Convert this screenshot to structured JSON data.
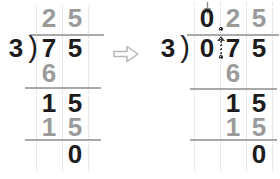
{
  "colors": {
    "background": "#ffffff",
    "black": "#1c1c1c",
    "gray": "#9b9b9b",
    "rule": "#a9a9a9",
    "guide": "#d4d4d4",
    "transform_arrow_outline": "#b7b7b7",
    "annotation_dark": "#3f3f3f",
    "annotation_gray": "#8a8a8a"
  },
  "icons": {
    "transform_arrow": "rightwards-white-arrow",
    "write_zero_arrow": "small-down-arrow",
    "decimal_carry_arrow": "dotted-up-arrow"
  },
  "figures": [
    {
      "divisor": "3",
      "dividend": "75",
      "quotient": "25",
      "work_rows": [
        "6",
        "15",
        "15",
        "0"
      ],
      "layout": {
        "col_centers": [
          49,
          75
        ],
        "rows_y": [
          8,
          38,
          63,
          93,
          117,
          144
        ],
        "guides_x": [
          36,
          62,
          88
        ],
        "guide_top": 6,
        "guide_bottom": 171,
        "bar": {
          "y": 34,
          "x1": 30,
          "x2": 104
        },
        "lines": [
          {
            "y": 87,
            "x1": 25,
            "x2": 101
          },
          {
            "y": 139,
            "x1": 25,
            "x2": 101
          }
        ]
      },
      "cells": [
        {
          "text": "3",
          "row": 1,
          "x": 16,
          "color": "black",
          "name": "divisor-digit"
        },
        {
          "text": ")",
          "row": 1,
          "x": 33,
          "kind": "paren",
          "color": "black",
          "name": "division-bracket-paren"
        },
        {
          "text": "2",
          "row": 0,
          "col": 0,
          "color": "gray",
          "name": "quotient-digit"
        },
        {
          "text": "5",
          "row": 0,
          "col": 1,
          "color": "gray",
          "name": "quotient-digit"
        },
        {
          "text": "7",
          "row": 1,
          "col": 0,
          "color": "black",
          "name": "dividend-digit"
        },
        {
          "text": "5",
          "row": 1,
          "col": 1,
          "color": "black",
          "name": "dividend-digit"
        },
        {
          "text": "6",
          "row": 2,
          "col": 0,
          "color": "gray",
          "name": "product-digit"
        },
        {
          "text": "1",
          "row": 3,
          "col": 0,
          "color": "black",
          "name": "remainder-digit"
        },
        {
          "text": "5",
          "row": 3,
          "col": 1,
          "color": "black",
          "name": "remainder-digit"
        },
        {
          "text": "1",
          "row": 4,
          "col": 0,
          "color": "gray",
          "name": "subtrahend-digit"
        },
        {
          "text": "5",
          "row": 4,
          "col": 1,
          "color": "gray",
          "name": "subtrahend-digit"
        },
        {
          "text": "0",
          "row": 5,
          "col": 1,
          "color": "black",
          "name": "final-remainder-digit"
        }
      ]
    },
    {
      "divisor": "3",
      "dividend": "0.75",
      "quotient": "0.25",
      "work_rows": [
        "6",
        "15",
        "15",
        "0"
      ],
      "layout": {
        "col_centers": [
          207,
          233,
          259
        ],
        "rows_y": [
          8,
          38,
          63,
          93,
          117,
          144
        ],
        "guides_x": [
          194,
          220,
          246,
          272
        ],
        "guide_top": 2,
        "guide_bottom": 171,
        "bar": {
          "y": 34,
          "x1": 187,
          "x2": 279
        },
        "lines": [
          {
            "y": 88,
            "x1": 190,
            "x2": 277
          },
          {
            "y": 139,
            "x1": 190,
            "x2": 277
          }
        ]
      },
      "cells": [
        {
          "text": "3",
          "row": 1,
          "x": 168,
          "color": "black",
          "name": "divisor-digit"
        },
        {
          "text": ")",
          "row": 1,
          "x": 185,
          "kind": "paren",
          "color": "black",
          "name": "division-bracket-paren"
        },
        {
          "text": "0",
          "row": 0,
          "col": 0,
          "color": "black",
          "name": "quotient-zero-digit"
        },
        {
          "text": "2",
          "row": 0,
          "col": 1,
          "color": "gray",
          "name": "quotient-digit"
        },
        {
          "text": "5",
          "row": 0,
          "col": 2,
          "color": "gray",
          "name": "quotient-digit"
        },
        {
          "text": "0",
          "row": 1,
          "col": 0,
          "color": "black",
          "name": "dividend-digit"
        },
        {
          "text": "7",
          "row": 1,
          "col": 1,
          "color": "black",
          "name": "dividend-digit"
        },
        {
          "text": "5",
          "row": 1,
          "col": 2,
          "color": "black",
          "name": "dividend-digit"
        },
        {
          "text": "6",
          "row": 2,
          "col": 1,
          "color": "gray",
          "name": "product-digit"
        },
        {
          "text": "1",
          "row": 3,
          "col": 1,
          "color": "black",
          "name": "remainder-digit"
        },
        {
          "text": "5",
          "row": 3,
          "col": 2,
          "color": "black",
          "name": "remainder-digit"
        },
        {
          "text": "1",
          "row": 4,
          "col": 1,
          "color": "gray",
          "name": "subtrahend-digit"
        },
        {
          "text": "5",
          "row": 4,
          "col": 2,
          "color": "gray",
          "name": "subtrahend-digit"
        },
        {
          "text": "0",
          "row": 5,
          "col": 2,
          "color": "black",
          "name": "final-remainder-digit"
        }
      ]
    }
  ]
}
